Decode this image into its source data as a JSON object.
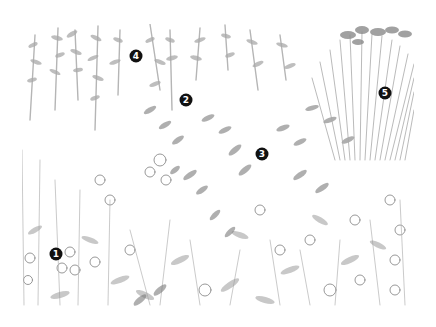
{
  "illustration": {
    "subject": "pencil sketch of a layered garden planting border",
    "palette": {
      "background": "#ffffff",
      "pencil_dark": "#6e6e6e",
      "pencil_mid": "#9a9a9a",
      "pencil_light": "#c8c8c8",
      "marker_fill": "#111111",
      "marker_text": "#ffffff"
    }
  },
  "markers": [
    {
      "label": "1",
      "x": 56,
      "y": 254
    },
    {
      "label": "2",
      "x": 186,
      "y": 100
    },
    {
      "label": "3",
      "x": 262,
      "y": 154
    },
    {
      "label": "4",
      "x": 136,
      "y": 56
    },
    {
      "label": "5",
      "x": 385,
      "y": 93
    }
  ]
}
